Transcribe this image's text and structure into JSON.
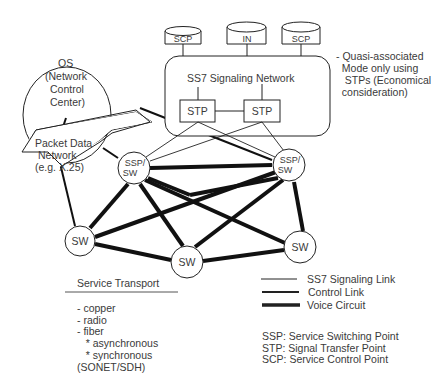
{
  "os": {
    "lines": [
      "OS",
      "(Network",
      "Control",
      "Center)"
    ]
  },
  "packet_network": {
    "lines": [
      "Packet Data",
      "Network",
      "(e.g. X.25)"
    ]
  },
  "databases": [
    {
      "label": "SCP"
    },
    {
      "label": "IN"
    },
    {
      "label": "SCP"
    }
  ],
  "ss7": {
    "title": "SS7 Signaling Network",
    "stps": [
      {
        "label": "STP"
      },
      {
        "label": "STP"
      }
    ]
  },
  "note": {
    "lines": [
      "- Quasi-associated",
      "  Mode only using",
      "   STPs (Economical",
      "  consideration)"
    ]
  },
  "nodes": {
    "ssp_left": {
      "line1": "SSP/",
      "line2": "SW"
    },
    "ssp_right": {
      "line1": "SSP/",
      "line2": "SW"
    },
    "sw_left": "SW",
    "sw_mid": "SW",
    "sw_right": "SW"
  },
  "service_transport": {
    "title": "Service Transport",
    "items": [
      "- copper",
      "- radio",
      "- fiber",
      "   * asynchronous",
      "   * synchronous",
      "(SONET/SDH)"
    ]
  },
  "legend": {
    "items": [
      {
        "label": "SS7 Signaling Link",
        "style": "thin"
      },
      {
        "label": "Control Link",
        "style": "medium"
      },
      {
        "label": "Voice Circuit",
        "style": "thick"
      }
    ]
  },
  "abbreviations": [
    "SSP: Service Switching Point",
    "STP: Signal Transfer Point",
    "SCP: Service Control Point"
  ],
  "colors": {
    "line": "#111111",
    "text": "#3a3a3a",
    "background": "#ffffff"
  }
}
